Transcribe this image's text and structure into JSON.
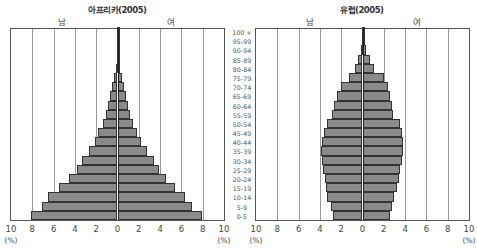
{
  "chart_data": [
    {
      "type": "bar",
      "subtype": "population-pyramid",
      "title": "아프리카(2005)",
      "left_label": "남",
      "right_label": "여",
      "xlabel": "(%)",
      "xlim": [
        -10,
        10
      ],
      "x_ticks": [
        "10",
        "8",
        "6",
        "4",
        "2",
        "0",
        "2",
        "4",
        "6",
        "8",
        "10"
      ],
      "categories": [
        "0-5",
        "5-9",
        "10-14",
        "15-19",
        "20-24",
        "25-29",
        "30-34",
        "35-39",
        "40-44",
        "45-49",
        "50-54",
        "55-59",
        "60-64",
        "65-69",
        "70-74",
        "75-79",
        "80-84",
        "85-89",
        "90-94",
        "95-99",
        "100 +"
      ],
      "series": [
        {
          "name": "남",
          "values": [
            8.1,
            7.1,
            6.5,
            5.5,
            4.6,
            3.8,
            3.3,
            2.7,
            2.1,
            1.8,
            1.4,
            1.1,
            0.9,
            0.7,
            0.5,
            0.3,
            0.15,
            0.05,
            0.03,
            0.02,
            0.01
          ]
        },
        {
          "name": "여",
          "values": [
            7.9,
            7.0,
            6.3,
            5.4,
            4.6,
            3.9,
            3.4,
            2.8,
            2.2,
            1.8,
            1.5,
            1.2,
            1.0,
            0.8,
            0.6,
            0.4,
            0.2,
            0.08,
            0.04,
            0.02,
            0.01
          ]
        }
      ]
    },
    {
      "type": "bar",
      "subtype": "population-pyramid",
      "title": "유럽(2005)",
      "left_label": "남",
      "right_label": "여",
      "xlabel": "(%)",
      "xlim": [
        -10,
        10
      ],
      "x_ticks": [
        "10",
        "8",
        "6",
        "4",
        "2",
        "0",
        "2",
        "4",
        "6",
        "8",
        "10"
      ],
      "categories": [
        "0-5",
        "5-9",
        "10-14",
        "15-19",
        "20-24",
        "25-29",
        "30-34",
        "35-39",
        "40-44",
        "45-49",
        "50-54",
        "55-59",
        "60-64",
        "65-69",
        "70-74",
        "75-79",
        "80-84",
        "85-89",
        "90-94",
        "95-99",
        "100 +"
      ],
      "series": [
        {
          "name": "남",
          "values": [
            2.8,
            3.0,
            3.3,
            3.4,
            3.5,
            3.7,
            3.8,
            3.9,
            3.8,
            3.6,
            3.3,
            2.9,
            2.7,
            2.4,
            2.0,
            1.3,
            0.7,
            0.4,
            0.15,
            0.05,
            0.02
          ]
        },
        {
          "name": "여",
          "values": [
            2.6,
            2.8,
            3.0,
            3.2,
            3.4,
            3.5,
            3.7,
            3.8,
            3.8,
            3.7,
            3.5,
            2.9,
            2.8,
            2.6,
            2.4,
            2.0,
            1.1,
            0.7,
            0.3,
            0.1,
            0.03
          ]
        }
      ]
    }
  ],
  "charts": [
    {
      "title": "아프리카(2005)",
      "male": "남",
      "female": "여"
    },
    {
      "title": "유럽(2005)",
      "male": "남",
      "female": "여"
    }
  ],
  "ticks": [
    "10",
    "8",
    "6",
    "4",
    "2",
    "0",
    "2",
    "4",
    "6",
    "8",
    "10"
  ],
  "unit": "(%)",
  "ages": [
    "100 +",
    "95-99",
    "90-94",
    "85-89",
    "80-84",
    "75-79",
    "70-74",
    "65-69",
    "60-64",
    "55-59",
    "50-54",
    "45-49",
    "40-44",
    "35-39",
    "30-34",
    "25-29",
    "20-24",
    "15-19",
    "10-14",
    "5-9",
    "0-5"
  ]
}
